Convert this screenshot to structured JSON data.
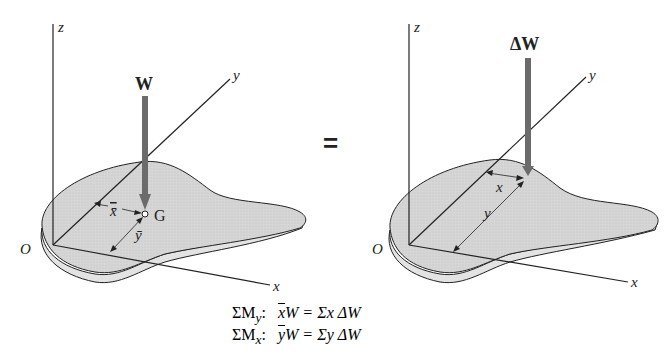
{
  "left_figure": {
    "axes": {
      "z": "z",
      "y": "y",
      "x": "x",
      "origin": "O"
    },
    "force_label": "W",
    "centroid_label": "G",
    "xbar_label": "x̄",
    "ybar_label": "ȳ"
  },
  "equals_sign": "=",
  "right_figure": {
    "axes": {
      "z": "z",
      "y": "y",
      "x": "x",
      "origin": "O"
    },
    "force_label": "ΔW",
    "x_label": "x",
    "y_label": "y"
  },
  "equations": [
    {
      "lhs": "ΣM",
      "sub": "y",
      "colon": ":",
      "bar": "x",
      "rhs": "W = Σx ΔW"
    },
    {
      "lhs": "ΣM",
      "sub": "x",
      "colon": ":",
      "bar": "y",
      "rhs": "W = Σy ΔW"
    }
  ],
  "colors": {
    "plate": "#d9d9d9",
    "arrow": "#6b6b6b",
    "line": "#222222"
  }
}
